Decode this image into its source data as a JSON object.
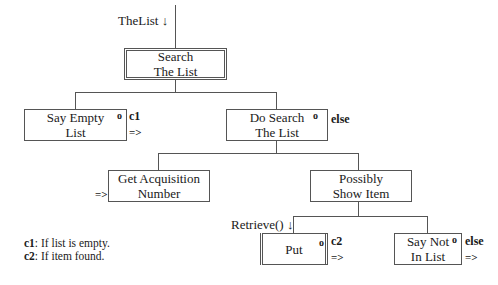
{
  "diagram": {
    "type": "warnier-orr / structure chart",
    "root_param": "TheList ↓",
    "nodes": {
      "search": {
        "line1": "Search",
        "line2": "The List"
      },
      "say_empty": {
        "line1": "Say Empty",
        "line2": "List",
        "marker": "o",
        "condition": "c1",
        "arrow": "=>"
      },
      "do_search": {
        "line1": "Do Search",
        "line2": "The List",
        "marker": "o",
        "condition": "else"
      },
      "get_acq": {
        "line1": "Get Acquisition",
        "line2": "Number",
        "arrow": "=>"
      },
      "possibly_show": {
        "line1": "Possibly",
        "line2": "Show Item"
      },
      "put": {
        "line1": "Put",
        "marker": "o",
        "condition": "c2",
        "arrow": "=>",
        "param": "Retrieve() ↓"
      },
      "say_not": {
        "line1": "Say Not",
        "line2": "In List",
        "marker": "o",
        "condition": "else",
        "arrow": "=>"
      }
    },
    "legend": [
      {
        "key": "c1",
        "text": ": If list is empty."
      },
      {
        "key": "c2",
        "text": ": If item found."
      }
    ]
  }
}
